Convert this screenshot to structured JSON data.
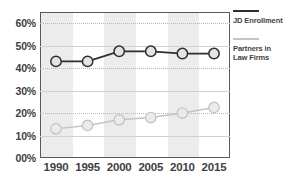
{
  "chart_data": {
    "type": "line",
    "title": "",
    "subtitle": "",
    "xlabel": "",
    "ylabel": "",
    "categories": [
      "1990",
      "1995",
      "2000",
      "2005",
      "2010",
      "2015"
    ],
    "x": [
      1990,
      1995,
      2000,
      2005,
      2010,
      2015
    ],
    "ylim": [
      0,
      65
    ],
    "ytick_values": [
      0,
      10,
      20,
      30,
      40,
      50,
      60
    ],
    "ytick_labels": [
      "00%",
      "10%",
      "20%",
      "30%",
      "40%",
      "50%",
      "60%"
    ],
    "grid": true,
    "legend_position": "right",
    "series": [
      {
        "name": "JD Enrollment",
        "color": "#2f2f31",
        "marker": "circle",
        "marker_fill": "#e4e4e6",
        "values": [
          43,
          43,
          47.5,
          47.5,
          46.5,
          46.5
        ]
      },
      {
        "name": "Partners in Law Firms",
        "color": "#c4c4c6",
        "marker": "circle",
        "marker_fill": "#ebebec",
        "values": [
          13,
          14.5,
          17,
          18,
          20,
          22.5
        ]
      }
    ],
    "annotations": []
  },
  "legend": {
    "items": [
      {
        "label": "JD Enrollment",
        "swatch": "dark"
      },
      {
        "label": "Partners in\nLaw Firms",
        "swatch": "light"
      }
    ],
    "item_0_label": "JD Enrollment",
    "item_1_label_line1": "Partners in",
    "item_1_label_line2": "Law Firms"
  },
  "colors": {
    "plot_border": "#59595b",
    "band": "#ececed",
    "gridline": "#b9b9bb",
    "text": "#3f3f41",
    "series_dark": "#2f2f31",
    "series_light": "#c4c4c6",
    "background": "#ffffff"
  }
}
